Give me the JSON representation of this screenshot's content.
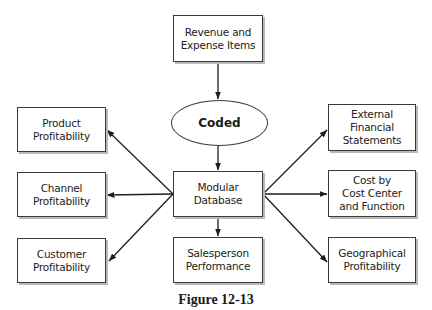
{
  "diagram": {
    "source": {
      "lines": [
        "Revenue and",
        "Expense Items"
      ]
    },
    "process": {
      "label": "Coded"
    },
    "hub": {
      "lines": [
        "Modular",
        "Database"
      ]
    },
    "outputs_left": [
      {
        "lines": [
          "Product",
          "Profitability"
        ]
      },
      {
        "lines": [
          "Channel",
          "Profitability"
        ]
      },
      {
        "lines": [
          "Customer",
          "Profitability"
        ]
      }
    ],
    "output_bottom": {
      "lines": [
        "Salesperson",
        "Performance"
      ]
    },
    "outputs_right": [
      {
        "lines": [
          "External",
          "Financial",
          "Statements"
        ]
      },
      {
        "lines": [
          "Cost by",
          "Cost Center",
          "and Function"
        ]
      },
      {
        "lines": [
          "Geographical",
          "Profitability"
        ]
      }
    ],
    "edges": [
      {
        "from": "Revenue and Expense Items",
        "to": "Coded"
      },
      {
        "from": "Coded",
        "to": "Modular Database"
      },
      {
        "from": "Modular Database",
        "to": "Product Profitability"
      },
      {
        "from": "Modular Database",
        "to": "Channel Profitability"
      },
      {
        "from": "Modular Database",
        "to": "Customer Profitability"
      },
      {
        "from": "Modular Database",
        "to": "Salesperson Performance"
      },
      {
        "from": "Modular Database",
        "to": "External Financial Statements"
      },
      {
        "from": "Modular Database",
        "to": "Cost by Cost Center and Function"
      },
      {
        "from": "Modular Database",
        "to": "Geographical Profitability"
      }
    ]
  },
  "caption": "Figure 12-13"
}
